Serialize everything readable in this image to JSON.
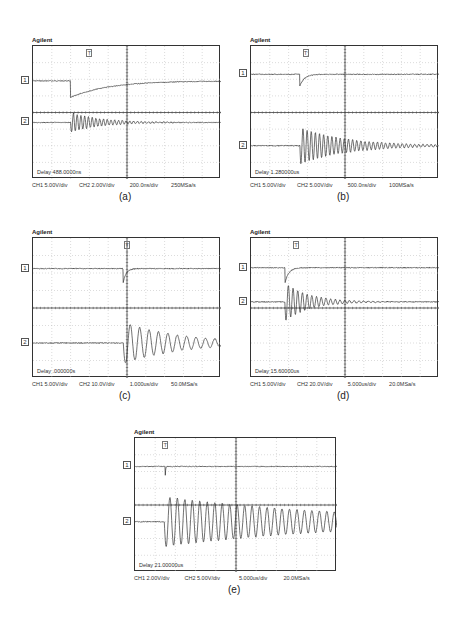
{
  "figure": {
    "panels": [
      {
        "id": "a",
        "brand": "Agilent",
        "caption": "(a)",
        "delay": "Delay 488.0000ns",
        "ch1_scale": "CH1 5.00V/div",
        "ch2_scale": "CH2 2.00V/div",
        "timebase": "200.0ns/div",
        "sample_rate": "250MSa/s",
        "box": {
          "x": 32,
          "y": 45,
          "w": 188,
          "h": 133
        },
        "trigger_x_frac": 0.3
      },
      {
        "id": "b",
        "brand": "Agilent",
        "caption": "(b)",
        "delay": "Delay 1.280000us",
        "ch1_scale": "CH1 5.00V/div",
        "ch2_scale": "CH2 5.00V/div",
        "timebase": "500.0ns/div",
        "sample_rate": "100MSa/s",
        "box": {
          "x": 250,
          "y": 45,
          "w": 188,
          "h": 133
        },
        "trigger_x_frac": 0.29
      },
      {
        "id": "c",
        "brand": "Agilent",
        "caption": "(c)",
        "delay": "Delay .000000s",
        "ch1_scale": "CH1 5.00V/div",
        "ch2_scale": "CH2 10.0V/div",
        "timebase": "1.000us/div",
        "sample_rate": "50.0MSa/s",
        "box": {
          "x": 32,
          "y": 237,
          "w": 188,
          "h": 140
        },
        "trigger_x_frac": 0.5
      },
      {
        "id": "d",
        "brand": "Agilent",
        "caption": "(d)",
        "delay": "Delay 15.60000us",
        "ch1_scale": "CH1 5.00V/div",
        "ch2_scale": "CH2 20.0V/div",
        "timebase": "5.000us/div",
        "sample_rate": "20.0MSa/s",
        "box": {
          "x": 250,
          "y": 237,
          "w": 188,
          "h": 140
        },
        "trigger_x_frac": 0.24
      },
      {
        "id": "e",
        "brand": "Agilent",
        "caption": "(e)",
        "delay": "Delay 21.00000us",
        "ch1_scale": "CH1 2.00V/div",
        "ch2_scale": "CH2 5.00V/div",
        "timebase": "5.000us/div",
        "sample_rate": "20.0MSa/s",
        "box": {
          "x": 134,
          "y": 437,
          "w": 202,
          "h": 134
        },
        "trigger_x_frac": 0.15
      }
    ],
    "channel_markers": {
      "ch1": "1",
      "ch2": "2",
      "trigger": "T"
    },
    "colors": {
      "trace": "#333333",
      "grid": "#b8b8b8",
      "frame": "#333333",
      "background": "#ffffff"
    }
  },
  "chart_data": [
    {
      "type": "line",
      "title": "(a)",
      "grid": {
        "divisions_x": 10,
        "divisions_y": 8
      },
      "xlabel": "200.0ns/div",
      "series": [
        {
          "name": "CH1",
          "scale": "5.00V/div",
          "level_div": 2.1,
          "event_div": 2.0,
          "shape": "step-down then exponential recovery",
          "drop_div": 1.0,
          "recovery_tau_div": 2.0
        },
        {
          "name": "CH2",
          "scale": "2.00V/div",
          "level_div": 4.6,
          "event_div": 2.0,
          "shape": "damped ringing",
          "amp_div": 0.6,
          "cycles_visible": 14,
          "period_div": 0.2,
          "decay_tau_div": 1.6
        }
      ],
      "annotation": "Delay 488.0000ns",
      "sample_rate": "250MSa/s"
    },
    {
      "type": "line",
      "title": "(b)",
      "grid": {
        "divisions_x": 10,
        "divisions_y": 8
      },
      "xlabel": "500.0ns/div",
      "series": [
        {
          "name": "CH1",
          "scale": "5.00V/div",
          "level_div": 1.7,
          "event_div": 2.6,
          "shape": "negative spike, fast recovery",
          "drop_div": 0.7,
          "recovery_tau_div": 0.25
        },
        {
          "name": "CH2",
          "scale": "5.00V/div",
          "level_div": 6.0,
          "event_div": 2.6,
          "shape": "damped ringing",
          "amp_div": 1.1,
          "period_div": 0.22,
          "decay_tau_div": 2.5
        }
      ],
      "annotation": "Delay 1.280000us",
      "sample_rate": "100MSa/s"
    },
    {
      "type": "line",
      "title": "(c)",
      "grid": {
        "divisions_x": 10,
        "divisions_y": 8
      },
      "xlabel": "1.000us/div",
      "series": [
        {
          "name": "CH1",
          "scale": "5.00V/div",
          "level_div": 1.75,
          "event_div": 4.8,
          "shape": "negative spike, fast recovery",
          "drop_div": 0.8,
          "recovery_tau_div": 0.15
        },
        {
          "name": "CH2",
          "scale": "10.0V/div",
          "level_div": 6.0,
          "event_div": 4.8,
          "shape": "damped ringing",
          "amp_div": 1.2,
          "period_div": 0.5,
          "decay_tau_div": 3.0
        }
      ],
      "annotation": "Delay .000000s",
      "sample_rate": "50.0MSa/s"
    },
    {
      "type": "line",
      "title": "(d)",
      "grid": {
        "divisions_x": 10,
        "divisions_y": 8
      },
      "xlabel": "5.000us/div",
      "series": [
        {
          "name": "CH1",
          "scale": "5.00V/div",
          "level_div": 1.7,
          "event_div": 1.8,
          "shape": "negative spike, fast recovery",
          "drop_div": 0.9,
          "recovery_tau_div": 0.2
        },
        {
          "name": "CH2",
          "scale": "20.0V/div",
          "level_div": 3.65,
          "event_div": 1.8,
          "shape": "damped ringing",
          "amp_div": 1.1,
          "period_div": 0.25,
          "decay_tau_div": 1.3
        }
      ],
      "annotation": "Delay 15.60000us",
      "sample_rate": "20.0MSa/s"
    },
    {
      "type": "line",
      "title": "(e)",
      "grid": {
        "divisions_x": 10,
        "divisions_y": 8
      },
      "xlabel": "5.000us/div",
      "series": [
        {
          "name": "CH1",
          "scale": "2.00V/div",
          "level_div": 1.7,
          "event_div": 1.5,
          "shape": "narrow negative glitch",
          "drop_div": 0.5,
          "recovery_tau_div": 0.02
        },
        {
          "name": "CH2",
          "scale": "5.00V/div",
          "level_div": 5.0,
          "event_div": 1.45,
          "shape": "slowly damped ringing",
          "amp_div": 1.5,
          "period_div": 0.37,
          "decay_tau_div": 9.0
        }
      ],
      "annotation": "Delay 21.00000us",
      "sample_rate": "20.0MSa/s"
    }
  ]
}
